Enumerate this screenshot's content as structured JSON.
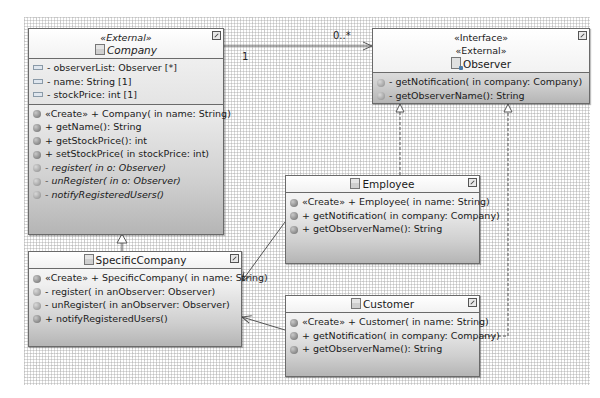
{
  "diagram": {
    "type": "UML class diagram",
    "classes": {
      "company": {
        "stereotype": "«External»",
        "name": "Company",
        "abstract": true,
        "attributes": [
          "- observerList: Observer [*]",
          "- name: String [1]",
          "- stockPrice: int [1]"
        ],
        "operations": [
          {
            "stereotype": "«Create»",
            "text": " + Company(  in name: String)",
            "italic": false
          },
          {
            "stereotype": "",
            "text": "+ getName(): String",
            "italic": false
          },
          {
            "stereotype": "",
            "text": "+ getStockPrice(): int",
            "italic": false
          },
          {
            "stereotype": "",
            "text": "+ setStockPrice(  in stockPrice: int)",
            "italic": false
          },
          {
            "stereotype": "",
            "text": "- register(  in o: Observer)",
            "italic": true
          },
          {
            "stereotype": "",
            "text": "- unRegister(  in o: Observer)",
            "italic": true
          },
          {
            "stereotype": "",
            "text": "- notifyRegisteredUsers()",
            "italic": true
          }
        ]
      },
      "observer": {
        "stereotypes": [
          "«Interface»",
          "«External»"
        ],
        "name": "Observer",
        "operations": [
          {
            "text": "- getNotification(  in company: Company)"
          },
          {
            "text": "- getObserverName(): String"
          }
        ]
      },
      "specific_company": {
        "name": "SpecificCompany",
        "operations": [
          {
            "stereotype": "«Create»",
            "text": " + SpecificCompany(  in name: String)"
          },
          {
            "stereotype": "",
            "text": "- register(  in anObserver: Observer)"
          },
          {
            "stereotype": "",
            "text": "- unRegister(  in anObserver: Observer)"
          },
          {
            "stereotype": "",
            "text": "+ notifyRegisteredUsers()"
          }
        ]
      },
      "employee": {
        "name": "Employee",
        "operations": [
          {
            "stereotype": "«Create»",
            "text": " + Employee(  in name: String)"
          },
          {
            "stereotype": "",
            "text": "+ getNotification(  in company: Company)"
          },
          {
            "stereotype": "",
            "text": "+ getObserverName(): String"
          }
        ]
      },
      "customer": {
        "name": "Customer",
        "operations": [
          {
            "stereotype": "«Create»",
            "text": " + Customer(  in name: String)"
          },
          {
            "stereotype": "",
            "text": "+ getNotification(  in company: Company)"
          },
          {
            "stereotype": "",
            "text": "+ getObserverName(): String"
          }
        ]
      }
    },
    "associations": [
      {
        "from": "Company",
        "to": "Observer",
        "kind": "directed-association",
        "source_multiplicity": "1",
        "target_multiplicity": "0..*"
      },
      {
        "from": "SpecificCompany",
        "to": "Company",
        "kind": "generalization"
      },
      {
        "from": "Employee",
        "to": "Observer",
        "kind": "realization"
      },
      {
        "from": "Customer",
        "to": "Observer",
        "kind": "realization"
      },
      {
        "from": "Employee",
        "to": "SpecificCompany",
        "kind": "dependency-arrow"
      },
      {
        "from": "Customer",
        "to": "SpecificCompany",
        "kind": "dependency-arrow"
      }
    ],
    "colors": {
      "box_border": "#6a6a6a",
      "box_gradient_top": "#fbfbfb",
      "box_gradient_bottom": "#b5b5b5",
      "line": "#555555"
    }
  }
}
